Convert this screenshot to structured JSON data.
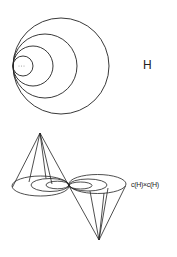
{
  "figure": {
    "top": {
      "label": "H",
      "description": "nested circles tangent at a common left point",
      "circles": [
        {
          "cx": 61,
          "cy": 66,
          "r": 48
        },
        {
          "cx": 45,
          "cy": 66,
          "r": 32
        },
        {
          "cx": 33,
          "cy": 66,
          "r": 20
        },
        {
          "cx": 23,
          "cy": 66,
          "r": 10
        }
      ],
      "inner_mark": "..."
    },
    "bottom": {
      "label": "c(H)×c(H)",
      "description": "two cones over nested ellipses meeting at a tangent point",
      "tangent_point": [
        69,
        186
      ],
      "upper_apex": [
        40,
        133
      ],
      "lower_apex": [
        99,
        240
      ]
    },
    "colors": {
      "stroke": "#222222",
      "background": "#ffffff"
    }
  }
}
